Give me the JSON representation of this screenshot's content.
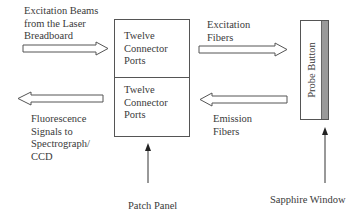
{
  "diagram": {
    "labels": {
      "excitation_beams": "Excitation Beams\nfrom the Laser\nBreadboard",
      "fluorescence_signals": "Fluorescence\nSignals to\nSpectrograph/\nCCD",
      "excitation_fibers": "Excitation\nFibers",
      "emission_fibers": "Emission\nFibers",
      "patch_panel": "Patch Panel",
      "sapphire_window": "Sapphire Window"
    },
    "patch_panel_box": {
      "top_section": "Twelve\nConnector\nPorts",
      "bottom_section": "Twelve\nConnector\nPorts"
    },
    "probe": {
      "label": "Probe Button"
    },
    "arrows": [
      {
        "from": "Excitation Beams from the Laser Breadboard",
        "to": "Patch Panel (top)",
        "direction": "right"
      },
      {
        "from": "Patch Panel (bottom)",
        "to": "Fluorescence Signals to Spectrograph/CCD",
        "direction": "left"
      },
      {
        "from": "Patch Panel (top)",
        "to": "Probe Button",
        "direction": "right",
        "label": "Excitation Fibers"
      },
      {
        "from": "Probe Button",
        "to": "Patch Panel (bottom)",
        "direction": "left",
        "label": "Emission Fibers"
      }
    ],
    "colors": {
      "line": "#555555",
      "window_strip": "#9a9a9a",
      "background": "#ffffff"
    }
  }
}
